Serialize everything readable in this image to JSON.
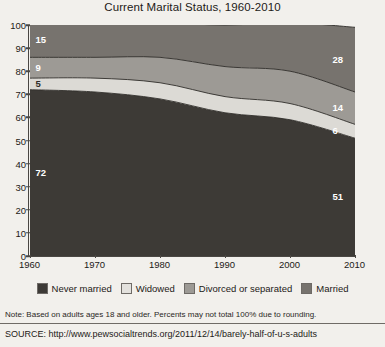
{
  "chart_data": {
    "type": "area",
    "stacked": true,
    "percent": true,
    "title": "Current Marital Status, 1960-2010",
    "xlabel": "",
    "ylabel": "",
    "x": [
      1960,
      1970,
      1980,
      1990,
      2000,
      2010
    ],
    "xticklabels": [
      "1960",
      "1970",
      "1980",
      "1990",
      "2000",
      "2010"
    ],
    "xlim": [
      1960,
      2010
    ],
    "ylim": [
      0,
      100
    ],
    "yticks": [
      0,
      10,
      20,
      30,
      40,
      50,
      60,
      70,
      80,
      90,
      100
    ],
    "yticklabels": [
      "0",
      "10",
      "20",
      "30",
      "40",
      "50",
      "60",
      "70",
      "80",
      "90",
      "100"
    ],
    "grid": false,
    "legend_position": "bottom",
    "stack_order_bottom_to_top": [
      "Married",
      "Widowed",
      "Divorced or separated",
      "Never married"
    ],
    "series": [
      {
        "name": "Married",
        "color": "#3d3a36",
        "values": [
          72,
          71,
          68,
          62,
          59,
          51
        ],
        "endpoint_labels": {
          "start": "72",
          "end": "51"
        }
      },
      {
        "name": "Widowed",
        "color": "#dcdad5",
        "values": [
          5,
          6,
          7,
          7,
          7,
          6
        ],
        "endpoint_labels": {
          "start": "5",
          "end": "6"
        }
      },
      {
        "name": "Divorced or separated",
        "color": "#9d9a95",
        "values": [
          9,
          9,
          11,
          13,
          14,
          14
        ],
        "endpoint_labels": {
          "start": "9",
          "end": "14"
        }
      },
      {
        "name": "Never married",
        "color": "#77736e",
        "values": [
          15,
          15,
          15,
          18,
          21,
          28
        ],
        "endpoint_labels": {
          "start": "15",
          "end": "28"
        }
      }
    ],
    "value_labels": [
      {
        "text": "15",
        "series": "Never married",
        "year": 1960,
        "color": "white"
      },
      {
        "text": "9",
        "series": "Divorced or separated",
        "year": 1960,
        "color": "white"
      },
      {
        "text": "5",
        "series": "Widowed",
        "year": 1960,
        "color": "dark"
      },
      {
        "text": "72",
        "series": "Married",
        "year": 1960,
        "color": "white"
      },
      {
        "text": "28",
        "series": "Never married",
        "year": 2010,
        "color": "white"
      },
      {
        "text": "6",
        "series": "Widowed",
        "year": 2010,
        "color": "white"
      },
      {
        "text": "14",
        "series": "Divorced or separated",
        "year": 2010,
        "color": "white"
      },
      {
        "text": "51",
        "series": "Married",
        "year": 2010,
        "color": "white"
      }
    ]
  },
  "legend": {
    "items": [
      {
        "label": "Never married",
        "color": "#3d3a36"
      },
      {
        "label": "Widowed",
        "color": "#e3e1dd"
      },
      {
        "label": "Divorced or separated",
        "color": "#9d9a95"
      },
      {
        "label": "Married",
        "color": "#77736e"
      }
    ]
  },
  "footer": {
    "note": "Note: Based on adults ages 18 and older. Percents may not total 100% due to rounding.",
    "source": "SOURCE: http://www.pewsocialtrends.org/2011/12/14/barely-half-of-u-s-adults"
  }
}
